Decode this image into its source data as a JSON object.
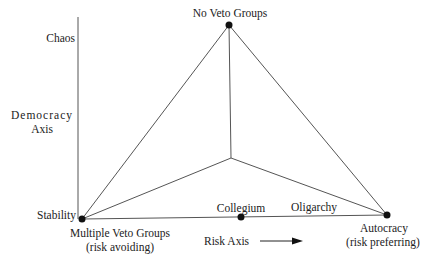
{
  "diagram": {
    "vertices": {
      "top": {
        "label": "No Veto Groups",
        "x": 229,
        "y": 25
      },
      "bottom_left": {
        "label": "Multiple Veto Groups",
        "sublabel": "(risk avoiding)",
        "x": 82,
        "y": 219
      },
      "bottom_right": {
        "label": "Autocracy",
        "sublabel": "(risk preferring)",
        "x": 387,
        "y": 215
      },
      "inner": {
        "x": 231,
        "y": 158
      },
      "collegium": {
        "label": "Collegium",
        "x": 241,
        "y": 217
      }
    },
    "vertical_axis": {
      "title_line1": "Democracy",
      "title_line2": "Axis",
      "top_label": "Chaos",
      "bottom_label": "Stability"
    },
    "horizontal_axis": {
      "title": "Risk Axis",
      "arrow": "right-arrow-icon"
    },
    "segment_labels": {
      "oligarchy": "Oligarchy"
    },
    "colors": {
      "line": "#555555",
      "dot": "#111111",
      "text": "#222222"
    }
  }
}
